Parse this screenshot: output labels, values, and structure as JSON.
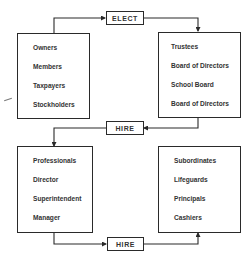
{
  "diagram": {
    "groups": {
      "owners": {
        "items": [
          "Owners",
          "Members",
          "Taxpayers",
          "Stockholders"
        ]
      },
      "boards": {
        "items": [
          "Trustees",
          "Board of Directors",
          "School Board",
          "Board of Directors"
        ]
      },
      "executives": {
        "items": [
          "Professionals",
          "Director",
          "Superintendent",
          "Manager"
        ]
      },
      "staff": {
        "items": [
          "Subordinates",
          "Lifeguards",
          "Principals",
          "Cashiers"
        ]
      }
    },
    "relations": {
      "elect": "ELECT",
      "hire_boards": "HIRE",
      "hire_staff": "HIRE"
    },
    "flow": [
      {
        "from": "owners",
        "via": "elect",
        "to": "boards"
      },
      {
        "from": "boards",
        "via": "hire_boards",
        "to": "executives"
      },
      {
        "from": "executives",
        "via": "hire_staff",
        "to": "staff"
      }
    ],
    "colors": {
      "line": "#2a2a2a",
      "background": "#ffffff"
    }
  }
}
